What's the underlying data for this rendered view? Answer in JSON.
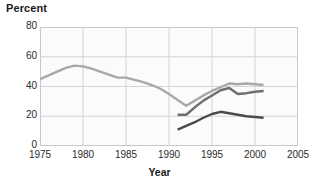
{
  "chart_data": {
    "type": "line",
    "title": "Percent",
    "xlabel": "Year",
    "ylabel": "",
    "xlim": [
      1975,
      2005
    ],
    "ylim": [
      0,
      80
    ],
    "xticks": [
      1975,
      1980,
      1985,
      1990,
      1995,
      2000,
      2005
    ],
    "yticks": [
      0,
      20,
      40,
      60,
      80
    ],
    "grid": true,
    "legend": "none",
    "series": [
      {
        "name": "series-light",
        "color": "#a8a8a8",
        "x": [
          1975,
          1976,
          1977,
          1978,
          1979,
          1980,
          1981,
          1982,
          1983,
          1984,
          1985,
          1986,
          1987,
          1988,
          1989,
          1990,
          1991,
          1992,
          1993,
          1994,
          1995,
          1996,
          1997,
          1998,
          1999,
          2000,
          2001
        ],
        "values": [
          45,
          47.5,
          50,
          52.5,
          54,
          53.5,
          52,
          50,
          48,
          46,
          46,
          44.5,
          43,
          41,
          38.5,
          35,
          31,
          27,
          30.5,
          34,
          37,
          39.5,
          42,
          41.5,
          42,
          41.5,
          41
        ]
      },
      {
        "name": "series-medium",
        "color": "#6e6e6e",
        "x": [
          1991,
          1992,
          1993,
          1994,
          1995,
          1996,
          1997,
          1998,
          1999,
          2000,
          2001
        ],
        "values": [
          21,
          21,
          26,
          30.5,
          34,
          37.5,
          39,
          35,
          35.5,
          36.5,
          37
        ]
      },
      {
        "name": "series-dark",
        "color": "#4a4a4a",
        "x": [
          1991,
          1992,
          1993,
          1994,
          1995,
          1996,
          1997,
          1998,
          1999,
          2000,
          2001
        ],
        "values": [
          11,
          13.5,
          16,
          19,
          21.5,
          23,
          22,
          21,
          20,
          19.5,
          19
        ]
      }
    ]
  },
  "colors": {
    "grid": "#d4d4d4",
    "frame": "#c9c9c9",
    "plot_background": "#fbfbfb",
    "text": "#1a1a1a"
  }
}
